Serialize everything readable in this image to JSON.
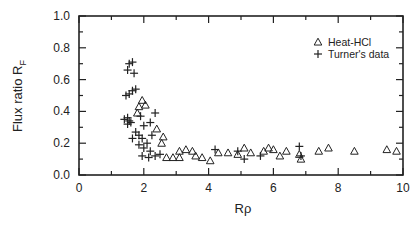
{
  "chart_data": {
    "type": "scatter",
    "title": "",
    "xlabel": "Rρ",
    "ylabel": "Flux ratio R",
    "ylabel_subscript": "F",
    "xlim": [
      0,
      10
    ],
    "ylim": [
      0.0,
      1.0
    ],
    "x_ticks": [
      "0",
      "2",
      "4",
      "6",
      "8",
      "10"
    ],
    "y_ticks": [
      "0.0",
      "0.2",
      "0.4",
      "0.6",
      "0.8",
      "1.0"
    ],
    "grid": false,
    "legend_position": "upper right",
    "series": [
      {
        "name": "Heat-HCl",
        "marker": "triangle-open",
        "points": [
          [
            1.95,
            0.47
          ],
          [
            1.85,
            0.43
          ],
          [
            1.8,
            0.39
          ],
          [
            2.05,
            0.44
          ],
          [
            2.4,
            0.29
          ],
          [
            2.6,
            0.24
          ],
          [
            2.55,
            0.2
          ],
          [
            3.1,
            0.15
          ],
          [
            3.3,
            0.16
          ],
          [
            3.5,
            0.15
          ],
          [
            2.7,
            0.11
          ],
          [
            2.9,
            0.11
          ],
          [
            3.1,
            0.11
          ],
          [
            3.6,
            0.12
          ],
          [
            3.8,
            0.11
          ],
          [
            4.05,
            0.09
          ],
          [
            4.3,
            0.14
          ],
          [
            4.6,
            0.14
          ],
          [
            4.9,
            0.13
          ],
          [
            5.1,
            0.17
          ],
          [
            5.3,
            0.14
          ],
          [
            5.7,
            0.15
          ],
          [
            5.85,
            0.17
          ],
          [
            6.0,
            0.16
          ],
          [
            6.2,
            0.12
          ],
          [
            6.4,
            0.15
          ],
          [
            6.8,
            0.13
          ],
          [
            6.85,
            0.1
          ],
          [
            7.4,
            0.15
          ],
          [
            7.7,
            0.17
          ],
          [
            8.5,
            0.15
          ],
          [
            9.5,
            0.16
          ],
          [
            9.8,
            0.15
          ]
        ]
      },
      {
        "name": "Turner's data",
        "marker": "plus",
        "points": [
          [
            1.55,
            0.7
          ],
          [
            1.65,
            0.71
          ],
          [
            1.5,
            0.66
          ],
          [
            1.7,
            0.64
          ],
          [
            1.45,
            0.5
          ],
          [
            1.55,
            0.51
          ],
          [
            1.65,
            0.53
          ],
          [
            1.75,
            0.54
          ],
          [
            1.4,
            0.35
          ],
          [
            1.5,
            0.36
          ],
          [
            1.55,
            0.34
          ],
          [
            1.6,
            0.33
          ],
          [
            1.5,
            0.32
          ],
          [
            1.9,
            0.37
          ],
          [
            2.35,
            0.39
          ],
          [
            2.0,
            0.31
          ],
          [
            2.2,
            0.33
          ],
          [
            1.75,
            0.27
          ],
          [
            1.85,
            0.25
          ],
          [
            1.65,
            0.23
          ],
          [
            1.95,
            0.23
          ],
          [
            2.1,
            0.2
          ],
          [
            2.25,
            0.25
          ],
          [
            1.85,
            0.19
          ],
          [
            2.0,
            0.17
          ],
          [
            2.2,
            0.15
          ],
          [
            1.95,
            0.12
          ],
          [
            2.15,
            0.11
          ],
          [
            2.35,
            0.12
          ],
          [
            2.5,
            0.13
          ],
          [
            4.2,
            0.16
          ],
          [
            4.9,
            0.15
          ],
          [
            5.1,
            0.1
          ],
          [
            5.6,
            0.12
          ],
          [
            6.8,
            0.18
          ],
          [
            6.85,
            0.12
          ]
        ]
      }
    ]
  },
  "legend": {
    "items": [
      {
        "symbol": "△",
        "label": "Heat-HCl"
      },
      {
        "symbol": "+",
        "label": "Turner's data"
      }
    ]
  },
  "axes": {
    "x_label": "Rρ",
    "y_label_main": "Flux ratio R",
    "y_label_sub": "F"
  },
  "colors": {
    "ink": "#222222",
    "background": "#ffffff"
  }
}
